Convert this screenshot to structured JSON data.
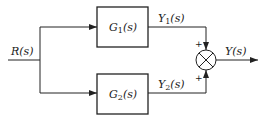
{
  "diagram": {
    "type": "block-diagram",
    "input": {
      "label": "R(s)",
      "base": "R",
      "arg": "(s)"
    },
    "blocks": [
      {
        "id": "g1",
        "base": "G",
        "sub": "1",
        "arg": "(s)",
        "output": {
          "base": "Y",
          "sub": "1",
          "arg": "(s)"
        }
      },
      {
        "id": "g2",
        "base": "G",
        "sub": "2",
        "arg": "(s)",
        "output": {
          "base": "Y",
          "sub": "2",
          "arg": "(s)"
        }
      }
    ],
    "summing_junction": {
      "symbol": "⊗",
      "signs": [
        "+",
        "+"
      ]
    },
    "output": {
      "label": "Y(s)",
      "base": "Y",
      "arg": "(s)"
    }
  }
}
